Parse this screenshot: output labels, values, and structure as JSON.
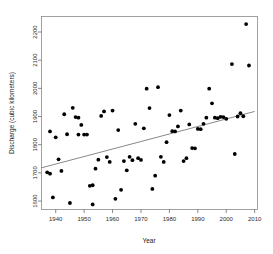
{
  "chart_data": {
    "type": "scatter",
    "title": "",
    "xlabel": "Year",
    "ylabel": "Discharge (cubic kilometers)",
    "xlim": [
      1935,
      2011
    ],
    "ylim": [
      1570,
      2255
    ],
    "xticks": [
      1940,
      1950,
      1960,
      1970,
      1980,
      1990,
      2000,
      2010
    ],
    "yticks": [
      1600,
      1700,
      1800,
      1900,
      2000,
      2100,
      2200
    ],
    "grid": false,
    "legend": null,
    "point_color": "#000000",
    "trend_color": "#555555",
    "frame_color": "#8a8a8a",
    "series": [
      {
        "name": "Annual discharge",
        "marker": "filled-circle",
        "points": [
          [
            1937,
            1702
          ],
          [
            1938,
            1697
          ],
          [
            1938,
            1847
          ],
          [
            1939,
            1613
          ],
          [
            1940,
            1826
          ],
          [
            1941,
            1748
          ],
          [
            1942,
            1707
          ],
          [
            1943,
            1908
          ],
          [
            1944,
            1837
          ],
          [
            1945,
            1593
          ],
          [
            1946,
            1931
          ],
          [
            1947,
            1898
          ],
          [
            1948,
            1896
          ],
          [
            1948,
            1836
          ],
          [
            1949,
            1870
          ],
          [
            1950,
            1836
          ],
          [
            1951,
            1836
          ],
          [
            1952,
            1654
          ],
          [
            1953,
            1588
          ],
          [
            1953,
            1656
          ],
          [
            1954,
            1715
          ],
          [
            1955,
            1747
          ],
          [
            1956,
            1902
          ],
          [
            1957,
            1918
          ],
          [
            1958,
            1756
          ],
          [
            1959,
            1739
          ],
          [
            1960,
            1921
          ],
          [
            1961,
            1608
          ],
          [
            1962,
            1852
          ],
          [
            1963,
            1640
          ],
          [
            1964,
            1742
          ],
          [
            1965,
            1709
          ],
          [
            1966,
            1757
          ],
          [
            1967,
            1745
          ],
          [
            1968,
            1874
          ],
          [
            1969,
            1752
          ],
          [
            1970,
            1746
          ],
          [
            1971,
            1858
          ],
          [
            1972,
            1999
          ],
          [
            1973,
            1930
          ],
          [
            1974,
            1643
          ],
          [
            1975,
            1690
          ],
          [
            1976,
            2004
          ],
          [
            1977,
            1757
          ],
          [
            1978,
            1739
          ],
          [
            1979,
            1809
          ],
          [
            1980,
            1905
          ],
          [
            1981,
            1848
          ],
          [
            1982,
            1847
          ],
          [
            1983,
            1865
          ],
          [
            1984,
            1921
          ],
          [
            1985,
            1742
          ],
          [
            1986,
            1752
          ],
          [
            1987,
            1872
          ],
          [
            1988,
            1788
          ],
          [
            1989,
            1787
          ],
          [
            1990,
            1856
          ],
          [
            1991,
            1855
          ],
          [
            1992,
            1874
          ],
          [
            1993,
            1896
          ],
          [
            1994,
            1999
          ],
          [
            1995,
            1947
          ],
          [
            1996,
            1896
          ],
          [
            1997,
            1894
          ],
          [
            1998,
            1899
          ],
          [
            1999,
            1898
          ],
          [
            2000,
            1892
          ],
          [
            2002,
            2086
          ],
          [
            2003,
            1767
          ],
          [
            2004,
            1900
          ],
          [
            2005,
            1912
          ],
          [
            2006,
            1901
          ],
          [
            2007,
            2228
          ],
          [
            2008,
            2081
          ]
        ]
      }
    ],
    "trendline": {
      "name": "linear-fit",
      "x_start": 1935,
      "y_start": 1718,
      "x_end": 2010,
      "y_end": 1918
    }
  }
}
